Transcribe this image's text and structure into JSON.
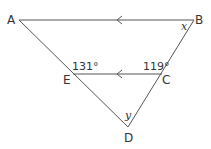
{
  "diagram": {
    "type": "geometry-triangle-parallel-lines",
    "points": {
      "A": {
        "label": "A",
        "x": 19,
        "y": 20
      },
      "B": {
        "label": "B",
        "x": 194,
        "y": 20
      },
      "C": {
        "label": "C",
        "x": 162,
        "y": 74
      },
      "D": {
        "label": "D",
        "x": 128,
        "y": 127
      },
      "E": {
        "label": "E",
        "x": 73,
        "y": 74
      }
    },
    "segments": [
      {
        "from": "A",
        "to": "B",
        "parallel_mark": "arrow-left"
      },
      {
        "from": "E",
        "to": "C",
        "parallel_mark": "arrow-left"
      },
      {
        "from": "A",
        "to": "D"
      },
      {
        "from": "B",
        "to": "D"
      }
    ],
    "angles": {
      "at_E": "131°",
      "at_C": "119°",
      "at_B": "x",
      "at_D": "y"
    },
    "colors": {
      "line": "#555555",
      "text": "#333333"
    }
  }
}
